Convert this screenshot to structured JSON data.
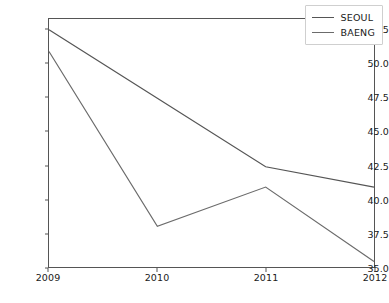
{
  "chart_data": {
    "type": "line",
    "title": "",
    "xlabel": "",
    "ylabel": "",
    "x": [
      2009,
      2010,
      2011,
      2012
    ],
    "categories": [
      "2009",
      "2010",
      "2011",
      "2012"
    ],
    "series": [
      {
        "name": "SEOUL",
        "values": [
          52.5,
          47.45,
          42.4,
          40.9
        ],
        "color": "#555555"
      },
      {
        "name": "BAENG",
        "values": [
          50.9,
          38.0,
          40.9,
          35.4
        ],
        "color": "#6b6b6b"
      }
    ],
    "xlim": [
      2009,
      2012
    ],
    "ylim": [
      35.0,
      53.3
    ],
    "yticks": [
      35.0,
      37.5,
      40.0,
      42.5,
      45.0,
      47.5,
      50.0,
      52.5
    ],
    "ytick_labels": [
      "35.0",
      "37.5",
      "40.0",
      "42.5",
      "45.0",
      "47.5",
      "50.0",
      "52.5"
    ],
    "xticks": [
      2009,
      2010,
      2011,
      2012
    ],
    "xtick_labels": [
      "2009",
      "2010",
      "2011",
      "2012"
    ],
    "grid": false,
    "legend_position": "upper right",
    "legend_entries": [
      "SEOUL",
      "BAENG"
    ]
  },
  "legend": {
    "items": [
      {
        "label": "SEOUL"
      },
      {
        "label": "BAENG"
      }
    ]
  }
}
